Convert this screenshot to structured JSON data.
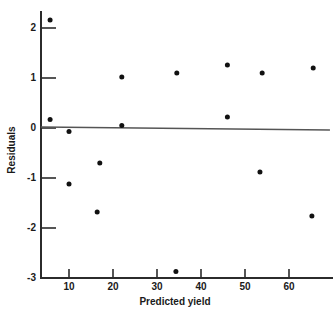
{
  "chart_data": {
    "type": "scatter",
    "title": "",
    "xlabel": "Predicted yield",
    "ylabel": "Residuals",
    "xlim": [
      3,
      70
    ],
    "ylim": [
      -3,
      2.4
    ],
    "xticks": [
      10,
      20,
      30,
      40,
      50,
      60
    ],
    "xticklabels": [
      "10",
      "20",
      "30",
      "40",
      "50",
      "60"
    ],
    "yticks": [
      -3,
      -2,
      -1,
      0,
      1,
      2
    ],
    "yticklabels": [
      "-3",
      "-2",
      "-1",
      "0",
      "1",
      "2"
    ],
    "grid": false,
    "legend": null,
    "reference_line": {
      "name": "zero-residual-line",
      "y_left": 0.02,
      "y_right": -0.04,
      "x_start": 3.6,
      "x_end": 69.3
    },
    "marker": {
      "shape": "circle",
      "color": "#111111",
      "size_px": 5
    },
    "points": [
      {
        "x": 5.7,
        "y": 2.16
      },
      {
        "x": 5.7,
        "y": 0.17
      },
      {
        "x": 10.0,
        "y": -0.07
      },
      {
        "x": 10.0,
        "y": -1.12
      },
      {
        "x": 16.4,
        "y": -1.68
      },
      {
        "x": 17.0,
        "y": -0.7
      },
      {
        "x": 22.0,
        "y": 1.02
      },
      {
        "x": 22.0,
        "y": 0.05
      },
      {
        "x": 34.3,
        "y": -2.87
      },
      {
        "x": 34.5,
        "y": 1.1
      },
      {
        "x": 46.0,
        "y": 1.26
      },
      {
        "x": 46.0,
        "y": 0.22
      },
      {
        "x": 53.4,
        "y": -0.88
      },
      {
        "x": 53.9,
        "y": 1.1
      },
      {
        "x": 65.2,
        "y": -1.76
      },
      {
        "x": 65.5,
        "y": 1.2
      }
    ]
  },
  "axes": {
    "x_title": "Predicted yield",
    "y_title": "Residuals",
    "x_tick_labels": [
      "10",
      "20",
      "30",
      "40",
      "50",
      "60"
    ],
    "y_tick_labels": [
      "2",
      "1",
      "0",
      "-1",
      "-2",
      "-3"
    ]
  },
  "colors": {
    "axis": "#2b2b2b",
    "marker": "#111111",
    "reference_line": "#555555",
    "background": "#ffffff"
  }
}
